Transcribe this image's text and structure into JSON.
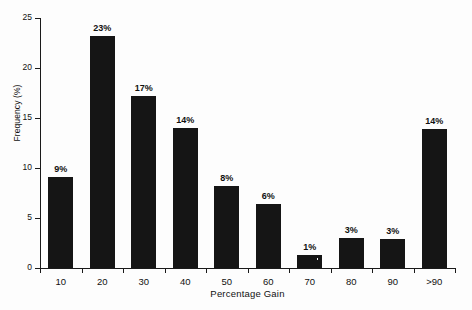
{
  "chart_data": {
    "type": "bar",
    "title": "",
    "xlabel": "Percentage Gain",
    "ylabel": "Frequency (%)",
    "categories": [
      "10",
      "20",
      "30",
      "40",
      "50",
      "60",
      "70",
      "80",
      "90",
      ">90"
    ],
    "values": [
      9.1,
      23.2,
      17.2,
      14.0,
      8.2,
      6.4,
      1.3,
      3.0,
      2.9,
      13.9
    ],
    "data_labels": [
      "9%",
      "23%",
      "17%",
      "14%",
      "8%",
      "6%",
      "1%",
      "3%",
      "3%",
      "14%"
    ],
    "ylim": [
      0,
      25
    ],
    "yticks": [
      0,
      5,
      10,
      15,
      20,
      25
    ],
    "ytick_labels": [
      "0",
      "5",
      "10",
      "15",
      "20",
      "25"
    ],
    "grid": false,
    "legend": false,
    "bar_color": "#151515",
    "axis_color": "#1a1a1a",
    "background": "#fdfdfd"
  }
}
